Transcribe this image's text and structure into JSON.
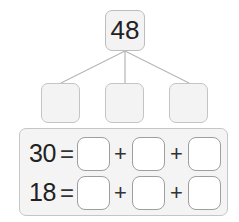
{
  "diagram": {
    "total": "48",
    "parts": [
      "",
      "",
      ""
    ],
    "equations": [
      {
        "value": "30",
        "equals": "=",
        "plus": "+",
        "blanks": [
          "",
          "",
          ""
        ]
      },
      {
        "value": "18",
        "equals": "=",
        "plus": "+",
        "blanks": [
          "",
          "",
          ""
        ]
      }
    ]
  },
  "colors": {
    "box_fill": "#f3f3f3",
    "box_border": "#bdbdbd",
    "answer_fill": "#ffffff",
    "answer_border": "#9e9e9e",
    "text": "#222222"
  }
}
